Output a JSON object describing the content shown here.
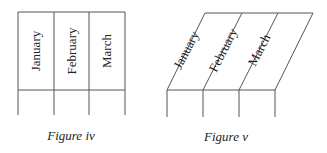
{
  "figures": [
    {
      "caption": "Figure iv",
      "style": "vertical",
      "columns": [
        "January",
        "February",
        "March"
      ]
    },
    {
      "caption": "Figure v",
      "style": "slanted",
      "columns": [
        "January",
        "February",
        "March"
      ]
    }
  ],
  "colors": {
    "line": "#555555",
    "text": "#222222",
    "background": "#ffffff"
  }
}
